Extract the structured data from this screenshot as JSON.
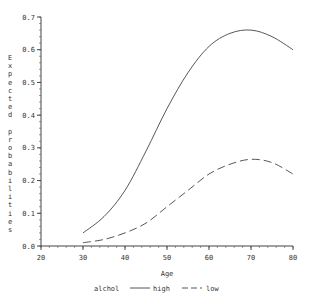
{
  "chart_data": {
    "type": "line",
    "title": "",
    "xlabel": "Age",
    "ylabel": "Expected probabilities",
    "xlim": [
      20,
      80
    ],
    "ylim": [
      0.0,
      0.7
    ],
    "xticks": [
      "20",
      "30",
      "40",
      "50",
      "60",
      "70",
      "80"
    ],
    "yticks": [
      "0.0",
      "0.1",
      "0.2",
      "0.3",
      "0.4",
      "0.5",
      "0.6",
      "0.7"
    ],
    "grid": false,
    "legend": {
      "title": "alchol",
      "position": "bottom",
      "entries": [
        "high",
        "low"
      ]
    },
    "x": [
      30,
      35,
      40,
      45,
      50,
      55,
      60,
      65,
      70,
      75,
      80
    ],
    "series": [
      {
        "name": "high",
        "style": "solid",
        "values": [
          0.04,
          0.09,
          0.17,
          0.29,
          0.42,
          0.53,
          0.61,
          0.65,
          0.66,
          0.64,
          0.6
        ]
      },
      {
        "name": "low",
        "style": "dashed",
        "values": [
          0.01,
          0.02,
          0.04,
          0.07,
          0.12,
          0.17,
          0.22,
          0.25,
          0.265,
          0.255,
          0.22
        ]
      }
    ]
  }
}
